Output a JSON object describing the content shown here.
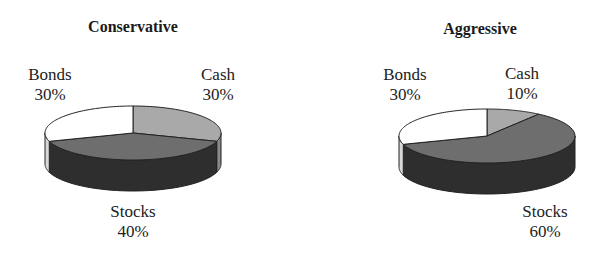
{
  "chart_data": [
    {
      "type": "pie",
      "style": "3d",
      "title": "Conservative",
      "categories": [
        "Cash",
        "Stocks",
        "Bonds"
      ],
      "values": [
        30,
        40,
        30
      ],
      "unit": "%",
      "labels": [
        {
          "name": "Bonds",
          "value": "30%"
        },
        {
          "name": "Cash",
          "value": "30%"
        },
        {
          "name": "Stocks",
          "value": "40%"
        }
      ],
      "legend": "none (direct labels)"
    },
    {
      "type": "pie",
      "style": "3d",
      "title": "Aggressive",
      "categories": [
        "Cash",
        "Stocks",
        "Bonds"
      ],
      "values": [
        10,
        60,
        30
      ],
      "unit": "%",
      "labels": [
        {
          "name": "Bonds",
          "value": "30%"
        },
        {
          "name": "Cash",
          "value": "10%"
        },
        {
          "name": "Stocks",
          "value": "60%"
        }
      ],
      "legend": "none (direct labels)"
    }
  ],
  "colors": {
    "cash": "#a9a9a9",
    "stocks_top": "#6e6e6e",
    "stocks_side": "#2e2e2e",
    "bonds": "#ffffff",
    "bonds_side": "#d8d8d8",
    "cash_side": "#8a8a8a",
    "outline": "#222222"
  },
  "charts": {
    "conservative": {
      "title": "Conservative",
      "bonds_name": "Bonds",
      "bonds_pct": "30%",
      "cash_name": "Cash",
      "cash_pct": "30%",
      "stocks_name": "Stocks",
      "stocks_pct": "40%"
    },
    "aggressive": {
      "title": "Aggressive",
      "bonds_name": "Bonds",
      "bonds_pct": "30%",
      "cash_name": "Cash",
      "cash_pct": "10%",
      "stocks_name": "Stocks",
      "stocks_pct": "60%"
    }
  }
}
